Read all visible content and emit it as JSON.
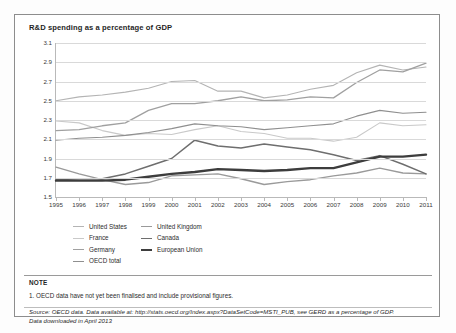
{
  "card": {
    "title": "R&D spending as a percentage of GDP"
  },
  "notes": {
    "heading": "NOTE",
    "items": [
      "1. OECD data have not yet been finalised and  include provisional figures."
    ],
    "source_line_1": "Source:  OECD data. Data available at: http://stats.oecd.org/Index.aspx?DataSetCode=MSTI_PUB, see GERD as a percentage of GDP.",
    "source_line_2": "Data downloaded in April 2013"
  },
  "legend": {
    "column_1": [
      {
        "label": "United States",
        "color": "#b4b4b4",
        "width": 1.1
      },
      {
        "label": "France",
        "color": "#c9c9c9",
        "width": 1.1
      },
      {
        "label": "Germany",
        "color": "#a0a0a0",
        "width": 1.3
      },
      {
        "label": "OECD total",
        "color": "#8f8f8f",
        "width": 1.1
      }
    ],
    "column_2": [
      {
        "label": "United Kingdom",
        "color": "#9a9a9a",
        "width": 1.4
      },
      {
        "label": "Canada",
        "color": "#6e6e6e",
        "width": 1.5
      },
      {
        "label": "European Union",
        "color": "#3d3d3d",
        "width": 2.4
      }
    ]
  },
  "chart_data": {
    "type": "line",
    "title": "R&D spending as a percentage of GDP",
    "xlabel": "",
    "ylabel": "",
    "grid": true,
    "legend_position": "below-plot",
    "x": [
      1995,
      1996,
      1997,
      1998,
      1999,
      2000,
      2001,
      2002,
      2003,
      2004,
      2005,
      2006,
      2007,
      2008,
      2009,
      2010,
      2011
    ],
    "xlim": [
      1995,
      2011
    ],
    "ylim": [
      1.5,
      3.1
    ],
    "ytick_labels": [
      "3.1",
      "2.9",
      "2.7",
      "2.5",
      "2.3",
      "2.1",
      "1.9",
      "1.7",
      "1.5"
    ],
    "ytick_values": [
      3.1,
      2.9,
      2.7,
      2.5,
      2.3,
      2.1,
      1.9,
      1.7,
      1.5
    ],
    "xtick_labels": [
      "1995",
      "1996",
      "1997",
      "1998",
      "1999",
      "2000",
      "2001",
      "2002",
      "2003",
      "2004",
      "2005",
      "2006",
      "2007",
      "2008",
      "2009",
      "2010",
      "2011"
    ],
    "series": [
      {
        "name": "United States",
        "color": "#b4b4b4",
        "width": 1.1,
        "values": [
          2.5,
          2.54,
          2.56,
          2.59,
          2.63,
          2.7,
          2.71,
          2.6,
          2.6,
          2.53,
          2.56,
          2.62,
          2.66,
          2.79,
          2.87,
          2.82,
          2.85
        ]
      },
      {
        "name": "France",
        "color": "#c9c9c9",
        "width": 1.1,
        "values": [
          2.29,
          2.27,
          2.19,
          2.14,
          2.16,
          2.15,
          2.2,
          2.24,
          2.18,
          2.16,
          2.11,
          2.11,
          2.08,
          2.12,
          2.27,
          2.24,
          2.25
        ]
      },
      {
        "name": "Germany",
        "color": "#a0a0a0",
        "width": 1.3,
        "values": [
          2.19,
          2.2,
          2.24,
          2.27,
          2.4,
          2.47,
          2.47,
          2.5,
          2.54,
          2.5,
          2.51,
          2.54,
          2.53,
          2.69,
          2.82,
          2.8,
          2.89
        ]
      },
      {
        "name": "OECD total",
        "color": "#8f8f8f",
        "width": 1.1,
        "values": [
          2.09,
          2.11,
          2.12,
          2.14,
          2.17,
          2.21,
          2.26,
          2.24,
          2.23,
          2.2,
          2.22,
          2.24,
          2.26,
          2.34,
          2.4,
          2.37,
          2.38
        ]
      },
      {
        "name": "United Kingdom",
        "color": "#9a9a9a",
        "width": 1.4,
        "values": [
          1.81,
          1.74,
          1.68,
          1.63,
          1.65,
          1.72,
          1.73,
          1.74,
          1.69,
          1.63,
          1.66,
          1.68,
          1.72,
          1.75,
          1.8,
          1.75,
          1.74
        ]
      },
      {
        "name": "Canada",
        "color": "#6e6e6e",
        "width": 1.5,
        "values": [
          1.68,
          1.69,
          1.69,
          1.74,
          1.82,
          1.9,
          2.09,
          2.03,
          2.01,
          2.05,
          2.02,
          1.99,
          1.94,
          1.88,
          1.93,
          1.84,
          1.74
        ]
      },
      {
        "name": "European Union",
        "color": "#3d3d3d",
        "width": 2.4,
        "values": [
          1.67,
          1.67,
          1.67,
          1.68,
          1.71,
          1.74,
          1.76,
          1.79,
          1.78,
          1.77,
          1.78,
          1.8,
          1.8,
          1.86,
          1.92,
          1.92,
          1.94
        ]
      }
    ]
  }
}
